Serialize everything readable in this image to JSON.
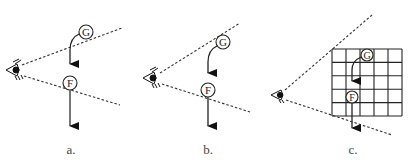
{
  "figure": {
    "panels": [
      {
        "id": "a",
        "caption": "a.",
        "ball_top": "G",
        "ball_bottom": "F",
        "has_grid": false
      },
      {
        "id": "b",
        "caption": "b.",
        "ball_top": "G",
        "ball_bottom": "F",
        "has_grid": false
      },
      {
        "id": "c",
        "caption": "c.",
        "ball_top": "G",
        "ball_bottom": "F",
        "has_grid": true,
        "grid": {
          "rows": 5,
          "cols": 5
        }
      }
    ],
    "icons": [
      "eye-icon",
      "arrow-down-icon"
    ],
    "colors": {
      "line": "#222222",
      "dash": "#333333",
      "background": "#ffffff"
    }
  }
}
